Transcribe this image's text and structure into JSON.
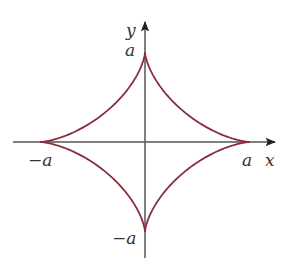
{
  "diagram": {
    "type": "astroid",
    "equation": "x^(2/3) + y^(2/3) = a^(2/3)",
    "colors": {
      "curve": "#8b2e3c",
      "axes": "#555555",
      "labels": "#333333"
    },
    "axes": {
      "x_label": "x",
      "y_label": "y"
    },
    "tick_labels": {
      "x_positive": "a",
      "x_negative": "−a",
      "y_positive": "a",
      "y_negative": "−a"
    },
    "geometry": {
      "origin": [
        145,
        142
      ],
      "a_x_px": 105,
      "a_y_px": 90
    }
  }
}
